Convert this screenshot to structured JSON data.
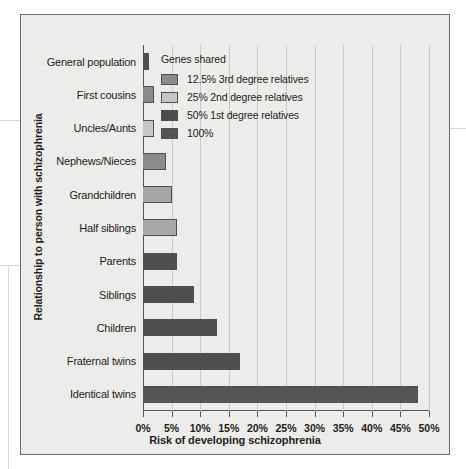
{
  "chart_data": {
    "type": "bar",
    "orientation": "horizontal",
    "title": "",
    "xlabel": "Risk of developing schizophrenia",
    "ylabel": "Relationship to person with schizophrenia",
    "xlim": [
      0,
      50
    ],
    "xtick_labels": [
      "0%",
      "5%",
      "10%",
      "15%",
      "20%",
      "25%",
      "30%",
      "35%",
      "40%",
      "45%",
      "50%"
    ],
    "xticks": [
      0,
      5,
      10,
      15,
      20,
      25,
      30,
      35,
      40,
      45,
      50
    ],
    "grid": "vertical",
    "categories": [
      "General population",
      "First cousins",
      "Uncles/Aunts",
      "Nephews/Nieces",
      "Grandchildren",
      "Half siblings",
      "Parents",
      "Siblings",
      "Children",
      "Fraternal twins",
      "Identical twins"
    ],
    "values": [
      1,
      2,
      2,
      4,
      5,
      6,
      6,
      9,
      13,
      17,
      48
    ],
    "bar_groups": [
      "12.5% 3rd degree relatives",
      "12.5% 3rd degree relatives",
      "25% 2nd degree relatives",
      "12.5% 3rd degree relatives",
      "25% 2nd degree relatives",
      "12.5% 3rd degree relatives",
      "50% 1st degree relatives",
      "50% 1st degree relatives",
      "50% 1st degree relatives",
      "50% 1st degree relatives",
      "100%"
    ],
    "bar_colors": [
      "#4f4f4f",
      "#8a8a8a",
      "#c6c6c4",
      "#8a8a8a",
      "#a6a6a4",
      "#a8a8a6",
      "#4f4f4f",
      "#4f4f4f",
      "#4f4f4f",
      "#4f4f4f",
      "#555555"
    ],
    "legend": {
      "position": "top-right",
      "title": "Genes shared",
      "entries": [
        {
          "label": "12.5% 3rd degree relatives",
          "color": "#8a8a8a"
        },
        {
          "label": "25% 2nd degree relatives",
          "color": "#c6c6c4"
        },
        {
          "label": "50% 1st degree relatives",
          "color": "#4a4a4a"
        },
        {
          "label": "100%",
          "color": "#555555"
        }
      ]
    },
    "colors": {
      "panel_background": "#ececeb",
      "panel_border": "#6d6d6d",
      "axis": "#555555",
      "gridline": "#c9c9c7",
      "text": "#231f20"
    }
  }
}
